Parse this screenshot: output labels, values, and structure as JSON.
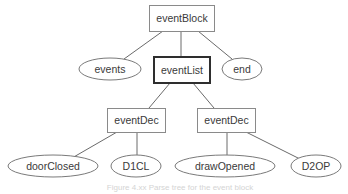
{
  "diagram": {
    "type": "parse-tree",
    "nodes": {
      "root": {
        "label": "eventBlock",
        "shape": "rectangle"
      },
      "events": {
        "label": "events",
        "shape": "ellipse"
      },
      "eventList": {
        "label": "eventList",
        "shape": "rectangle",
        "emphasis": "bold-border"
      },
      "end": {
        "label": "end",
        "shape": "ellipse"
      },
      "eventDec1": {
        "label": "eventDec",
        "shape": "rectangle"
      },
      "eventDec2": {
        "label": "eventDec",
        "shape": "rectangle"
      },
      "doorClosed": {
        "label": "doorClosed",
        "shape": "ellipse"
      },
      "d1cl": {
        "label": "D1CL",
        "shape": "ellipse"
      },
      "drawOpened": {
        "label": "drawOpened",
        "shape": "ellipse"
      },
      "d2op": {
        "label": "D2OP",
        "shape": "ellipse"
      }
    },
    "edges": [
      [
        "eventBlock",
        "events"
      ],
      [
        "eventBlock",
        "eventList"
      ],
      [
        "eventBlock",
        "end"
      ],
      [
        "eventList",
        "eventDec"
      ],
      [
        "eventList",
        "eventDec"
      ],
      [
        "eventDec",
        "doorClosed"
      ],
      [
        "eventDec",
        "D1CL"
      ],
      [
        "eventDec",
        "drawOpened"
      ],
      [
        "eventDec",
        "D2OP"
      ]
    ],
    "caption": "Figure 4.xx  Parse tree for the event block"
  },
  "colors": {
    "edge": "#6a6a6a",
    "box_border": "#8a8a8a",
    "emphasis_border": "#2e2e2e",
    "text": "#3a3a3a",
    "caption": "#d4d4d4"
  }
}
